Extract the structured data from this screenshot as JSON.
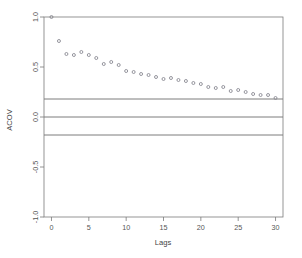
{
  "chart_data": {
    "type": "scatter",
    "title": "",
    "xlabel": "Lags",
    "ylabel": "ACOV",
    "xlim": [
      -1,
      31
    ],
    "ylim": [
      -1.0,
      1.0
    ],
    "grid": false,
    "legend": "none",
    "x_ticks": [
      0,
      5,
      10,
      15,
      20,
      25,
      30
    ],
    "x_tick_labels": [
      "0",
      "5",
      "10",
      "15",
      "20",
      "25",
      "30"
    ],
    "y_ticks": [
      -1.0,
      -0.5,
      0.0,
      0.5,
      1.0
    ],
    "y_tick_labels": [
      "-1.0",
      "-0.5",
      "0.0",
      "0.5",
      "1.0"
    ],
    "point_marker": "open-circle",
    "point_color": "#8a8a93",
    "reference_lines": [
      {
        "name": "upper-confidence-band",
        "value": 0.18,
        "color": "#6e6e6e"
      },
      {
        "name": "zero-line",
        "value": 0.0,
        "color": "#6e6e6e"
      },
      {
        "name": "lower-confidence-band",
        "value": -0.18,
        "color": "#6e6e6e"
      }
    ],
    "x": [
      0,
      1,
      2,
      3,
      4,
      5,
      6,
      7,
      8,
      9,
      10,
      11,
      12,
      13,
      14,
      15,
      16,
      17,
      18,
      19,
      20,
      21,
      22,
      23,
      24,
      25,
      26,
      27,
      28,
      29,
      30
    ],
    "values": [
      1.0,
      0.76,
      0.63,
      0.62,
      0.65,
      0.62,
      0.59,
      0.53,
      0.55,
      0.52,
      0.46,
      0.45,
      0.43,
      0.42,
      0.4,
      0.38,
      0.39,
      0.37,
      0.36,
      0.34,
      0.33,
      0.3,
      0.29,
      0.3,
      0.26,
      0.27,
      0.25,
      0.23,
      0.22,
      0.22,
      0.19
    ]
  },
  "axes": {
    "x_title": "Lags",
    "y_title": "ACOV"
  }
}
